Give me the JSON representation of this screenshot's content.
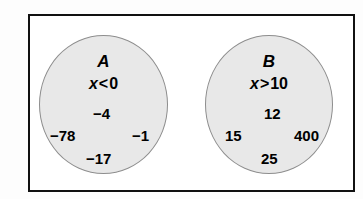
{
  "diagram": {
    "type": "set-membership-diagram",
    "frame_color": "#111111",
    "circle_fill": "#e8e8e8",
    "circle_stroke": "#8d8d8d",
    "text_color": "#000000",
    "sets": [
      {
        "id": "A",
        "label": "A",
        "condition": {
          "variable": "x",
          "operator": "<",
          "value": "0",
          "text": "x < 0"
        },
        "members": [
          "−4",
          "−78",
          "−1",
          "−17"
        ]
      },
      {
        "id": "B",
        "label": "B",
        "condition": {
          "variable": "x",
          "operator": ">",
          "value": "10",
          "text": "x > 10"
        },
        "members": [
          "12",
          "15",
          "400",
          "25"
        ]
      }
    ]
  }
}
